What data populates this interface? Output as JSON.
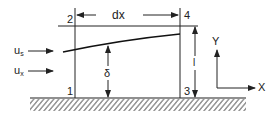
{
  "diagram": {
    "stations": [
      "1",
      "2",
      "3",
      "4"
    ],
    "dimension_top": "dx",
    "delta_label": "δ",
    "height_label": "l",
    "inflow_labels": [
      {
        "base": "u",
        "sub": "s"
      },
      {
        "base": "u",
        "sub": "x"
      }
    ],
    "axes": {
      "x": "X",
      "y": "Y"
    },
    "colors": {
      "line": "#222222",
      "background": "#ffffff"
    }
  }
}
